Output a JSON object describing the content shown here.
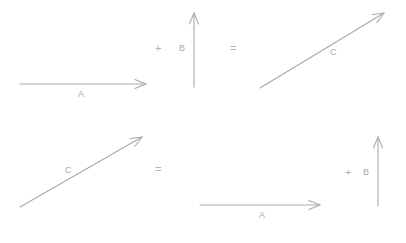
{
  "figure": {
    "background_color": "#ffffff",
    "stroke_color": "#a9a9a9",
    "label_color": "#a9a9a9",
    "operator_color": "#b3b3b3"
  },
  "rows": [
    {
      "id": "top-row",
      "expression": "A + B = C",
      "terms": [
        {
          "id": "top-vector-a",
          "label": "A",
          "label_x": 78,
          "label_y": 90,
          "direction": "right",
          "x1": 20,
          "y1": 84,
          "x2": 146,
          "y2": 84
        },
        {
          "id": "top-plus",
          "label": "+",
          "label_x": 155,
          "label_y": 43,
          "kind": "operator"
        },
        {
          "id": "top-vector-b",
          "label": "B",
          "label_x": 179,
          "label_y": 44,
          "direction": "up",
          "x1": 194,
          "y1": 87,
          "x2": 194,
          "y2": 13
        },
        {
          "id": "top-equals",
          "label": "=",
          "label_x": 230,
          "label_y": 43,
          "kind": "operator"
        },
        {
          "id": "top-vector-c",
          "label": "C",
          "label_x": 330,
          "label_y": 48,
          "direction": "up-right",
          "x1": 260,
          "y1": 88,
          "x2": 384,
          "y2": 13
        }
      ]
    },
    {
      "id": "bottom-row",
      "expression": "C = A + B",
      "terms": [
        {
          "id": "bottom-vector-c",
          "label": "C",
          "label_x": 65,
          "label_y": 166,
          "direction": "up-right",
          "x1": 20,
          "y1": 207,
          "x2": 142,
          "y2": 137
        },
        {
          "id": "bottom-equals",
          "label": "=",
          "label_x": 155,
          "label_y": 164,
          "kind": "operator"
        },
        {
          "id": "bottom-vector-a",
          "label": "A",
          "label_x": 259,
          "label_y": 211,
          "direction": "right",
          "x1": 200,
          "y1": 205,
          "x2": 320,
          "y2": 205
        },
        {
          "id": "bottom-plus",
          "label": "+",
          "label_x": 345,
          "label_y": 167,
          "kind": "operator"
        },
        {
          "id": "bottom-vector-b",
          "label": "B",
          "label_x": 363,
          "label_y": 168,
          "direction": "up",
          "x1": 378,
          "y1": 206,
          "x2": 378,
          "y2": 137
        }
      ]
    }
  ]
}
